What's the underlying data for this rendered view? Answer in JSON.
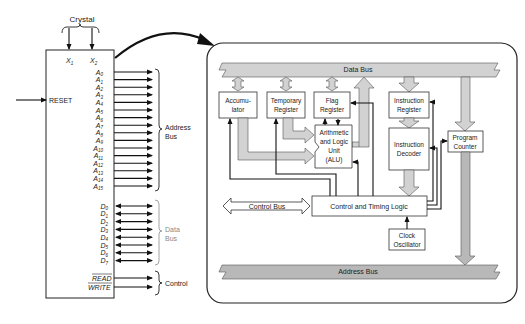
{
  "chip": {
    "crystal_label": "Crystal",
    "x_pins": [
      "X",
      "X"
    ],
    "x_subs": [
      "1",
      "2"
    ],
    "reset_label": "RESET",
    "address_pins": [
      "0",
      "1",
      "2",
      "3",
      "4",
      "5",
      "6",
      "7",
      "8",
      "9",
      "10",
      "11",
      "12",
      "13",
      "14",
      "15"
    ],
    "address_prefix": "A",
    "address_bus_label_1": "Address",
    "address_bus_label_2": "Bus",
    "data_pins": [
      "0",
      "1",
      "2",
      "3",
      "4",
      "5",
      "6",
      "7"
    ],
    "data_prefix": "D",
    "data_bus_label_1": "Data",
    "data_bus_label_2": "Bus",
    "read_label": "READ",
    "write_label": "WRITE",
    "control_label": "Control"
  },
  "internal": {
    "data_bus_label": "Data Bus",
    "address_bus_label": "Address Bus",
    "accumulator_1": "Accumu-",
    "accumulator_2": "lator",
    "temp_register_1": "Temporary",
    "temp_register_2": "Register",
    "flag_register_1": "Flag",
    "flag_register_2": "Register",
    "alu_1": "Arithmetic",
    "alu_2": "and Logic",
    "alu_3": "Unit",
    "alu_4": "(ALU)",
    "instruction_register_1": "Instruction",
    "instruction_register_2": "Register",
    "instruction_decoder_1": "Instruction",
    "instruction_decoder_2": "Decoder",
    "program_counter_1": "Program",
    "program_counter_2": "Counter",
    "control_bus_label": "Control Bus",
    "control_timing_label": "Control and Timing Logic",
    "clock_oscillator_1": "Clock",
    "clock_oscillator_2": "Oscillator"
  },
  "colors": {
    "bus_fill": "#d2d2d2",
    "address_bus_fill": "#b8b8b8",
    "outline": "#333333"
  }
}
